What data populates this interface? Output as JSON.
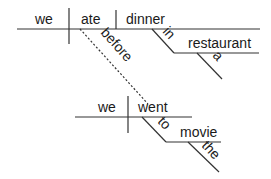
{
  "diagram": {
    "type": "sentence-diagram",
    "main_clause": {
      "subject": "we",
      "verb": "ate",
      "object": "dinner",
      "modifier_preposition": "in",
      "modifier_object": "restaurant",
      "modifier_article": "a"
    },
    "connector": "before",
    "sub_clause": {
      "subject": "we",
      "verb": "went",
      "modifier_preposition": "to",
      "modifier_object": "movie",
      "modifier_article": "the"
    },
    "line_color": "#333333"
  }
}
